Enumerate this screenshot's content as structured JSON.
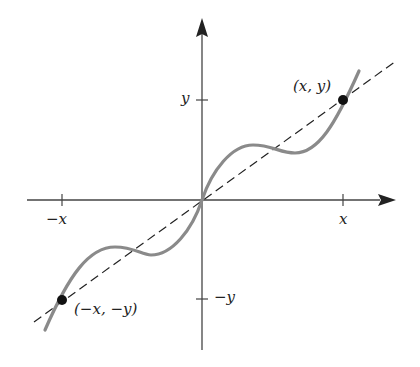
{
  "figure": {
    "axis_labels": {
      "x_tick_pos": "x",
      "x_tick_neg": "−x",
      "y_tick_pos": "y",
      "y_tick_neg": "−y"
    },
    "points": [
      {
        "label": "(x, y)"
      },
      {
        "label": "(−x, −y)"
      }
    ],
    "colors": {
      "axes": "#333333",
      "curve": "#8a8a8a",
      "dashed_line": "#222222",
      "point": "#111111"
    }
  }
}
